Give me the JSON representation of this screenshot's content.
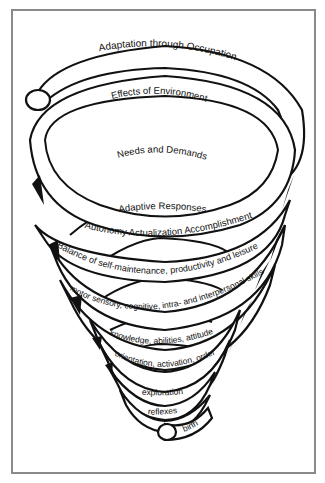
{
  "diagram": {
    "type": "spiral",
    "levels": [
      {
        "id": "adaptation",
        "label": "Adaptation through Occupation"
      },
      {
        "id": "environment",
        "label": "Effects of Environment"
      },
      {
        "id": "needs",
        "label": "Needs and Demands"
      },
      {
        "id": "adaptive",
        "label": "Adaptive Responses"
      },
      {
        "id": "autonomy",
        "label": "Autonomy  Actualization  Accomplishment"
      },
      {
        "id": "balance",
        "label": "Balance of self-maintenance, productivity and leisure"
      },
      {
        "id": "motor",
        "label": "motor  sensory, cognitive, intra- and interpersonal skills"
      },
      {
        "id": "knowledge",
        "label": "knowledge, abilities, attitude"
      },
      {
        "id": "orientation",
        "label": "orientation,  activation,  order"
      },
      {
        "id": "exploration",
        "label": "exploration"
      },
      {
        "id": "reflexes",
        "label": "reflexes"
      },
      {
        "id": "birth",
        "label": "birth"
      }
    ],
    "colors": {
      "stroke": "#111111",
      "background": "#ffffff",
      "frame": "#8a8a8a"
    }
  }
}
